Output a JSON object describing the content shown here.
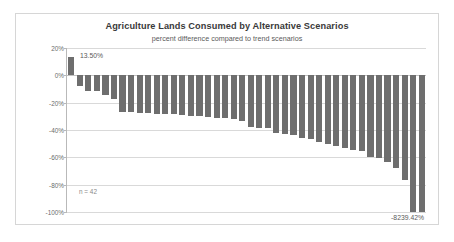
{
  "chart_data": {
    "type": "bar",
    "title": "Agriculture Lands Consumed by Alternative Scenarios",
    "subtitle": "percent difference compared to trend scenarios",
    "xlabel": "",
    "ylabel": "",
    "ylim": [
      -100,
      20
    ],
    "grid": true,
    "legend": "none",
    "bar_color": "#6e6e6e",
    "sample_note": "n = 42",
    "ytick_labels": [
      "20%",
      "0%",
      "-20%",
      "-40%",
      "-60%",
      "-80%",
      "-100%"
    ],
    "ytick_values": [
      20,
      0,
      -20,
      -40,
      -60,
      -80,
      -100
    ],
    "data_labels": {
      "first": "13.50%",
      "last": "-8239.42%"
    },
    "categories": [
      "1",
      "2",
      "3",
      "4",
      "5",
      "6",
      "7",
      "8",
      "9",
      "10",
      "11",
      "12",
      "13",
      "14",
      "15",
      "16",
      "17",
      "18",
      "19",
      "20",
      "21",
      "22",
      "23",
      "24",
      "25",
      "26",
      "27",
      "28",
      "29",
      "30",
      "31",
      "32",
      "33",
      "34",
      "35",
      "36",
      "37",
      "38",
      "39",
      "40",
      "41",
      "42"
    ],
    "values": [
      13.5,
      -7.5,
      -11.5,
      -11.5,
      -14.5,
      -17.5,
      -26.5,
      -27,
      -27.5,
      -27.5,
      -28,
      -28,
      -28.5,
      -29,
      -29.5,
      -30,
      -30.5,
      -31,
      -31.5,
      -32,
      -33.5,
      -37.5,
      -38.5,
      -38.5,
      -42.5,
      -43,
      -43.5,
      -45.5,
      -46.5,
      -48.5,
      -50,
      -51.5,
      -53.5,
      -55,
      -55.5,
      -60,
      -60.5,
      -63.5,
      -67.5,
      -76.5,
      -100,
      -100
    ]
  }
}
